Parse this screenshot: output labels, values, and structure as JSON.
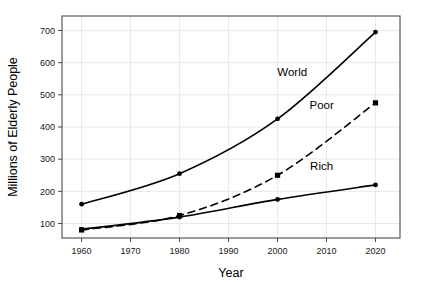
{
  "chart_data": {
    "type": "line",
    "title": "",
    "xlabel": "Year",
    "ylabel": "Millions of Elderly People",
    "x": [
      1960,
      1980,
      2000,
      2020
    ],
    "xlim": [
      1956,
      2025
    ],
    "ylim": [
      55,
      745
    ],
    "xticks": [
      1960,
      1970,
      1980,
      1990,
      2000,
      2010,
      2020
    ],
    "xtick_labels": [
      "1960",
      "1970",
      "1980",
      "1990",
      "2000",
      "2010",
      "2020"
    ],
    "yticks": [
      100,
      200,
      300,
      400,
      500,
      600,
      700
    ],
    "ytick_labels": [
      "100",
      "200",
      "300",
      "400",
      "500",
      "600",
      "700"
    ],
    "grid": true,
    "grid_color": "#e3e3e8",
    "legend_position": "inline-annotations",
    "background_color": "#ffffff",
    "line_color": "#000000",
    "series": [
      {
        "name": "World",
        "label": "World",
        "style": "solid",
        "marker": "circle",
        "values": [
          160,
          255,
          425,
          695
        ],
        "label_x": 2003,
        "label_y": 560
      },
      {
        "name": "Poor",
        "label": "Poor",
        "style": "dashed",
        "marker": "square",
        "values": [
          80,
          125,
          250,
          475
        ],
        "label_x": 2009,
        "label_y": 455
      },
      {
        "name": "Rich",
        "label": "Rich",
        "style": "solid",
        "marker": "circle",
        "values": [
          82,
          120,
          175,
          220
        ],
        "label_x": 2009,
        "label_y": 265
      }
    ]
  }
}
